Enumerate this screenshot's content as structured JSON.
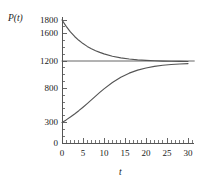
{
  "chart_data": {
    "type": "line",
    "title": "",
    "subtitle": "",
    "xlabel": "t",
    "ylabel": "P(t)",
    "xlim": [
      0,
      31.5
    ],
    "ylim": [
      0,
      1850
    ],
    "grid": false,
    "legend": "none",
    "xticks": [
      0,
      5,
      10,
      15,
      20,
      25,
      30
    ],
    "xtick_labels": [
      "0",
      "5",
      "10",
      "15",
      "20",
      "25",
      "30"
    ],
    "x_minor_tick_step": 1,
    "yticks": [
      0,
      300,
      800,
      1200,
      1600,
      1800
    ],
    "ytick_labels": [
      "0",
      "300",
      "800",
      "1200",
      "1600",
      "1800"
    ],
    "y_minor_tick_step": 100,
    "annotations": [
      {
        "name": "asymptote",
        "value": 1200,
        "orientation": "horizontal"
      }
    ],
    "series": [
      {
        "name": "upper-solution",
        "color": "#555555",
        "x": [
          0,
          1,
          2,
          3,
          4,
          5,
          6,
          7,
          8,
          9,
          10,
          12,
          14,
          16,
          18,
          20,
          22,
          24,
          26,
          28,
          30
        ],
        "values": [
          1800,
          1706,
          1626,
          1559,
          1503,
          1455,
          1414,
          1380,
          1351,
          1326,
          1304,
          1270,
          1246,
          1229,
          1217,
          1209,
          1203,
          1199,
          1196,
          1194,
          1193
        ]
      },
      {
        "name": "lower-solution",
        "color": "#555555",
        "x": [
          0,
          1,
          2,
          3,
          4,
          5,
          6,
          7,
          8,
          9,
          10,
          12,
          14,
          16,
          18,
          20,
          22,
          24,
          26,
          28,
          30
        ],
        "values": [
          300,
          338,
          380,
          425,
          473,
          524,
          577,
          631,
          686,
          740,
          792,
          886,
          963,
          1022,
          1066,
          1098,
          1121,
          1137,
          1148,
          1156,
          1162
        ]
      },
      {
        "name": "equilibrium-line",
        "color": "#555555",
        "x": [
          0,
          31.5
        ],
        "values": [
          1200,
          1200
        ]
      }
    ]
  }
}
